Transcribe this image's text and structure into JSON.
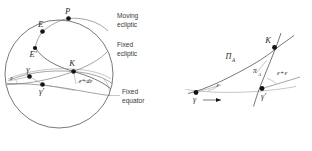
{
  "figure": {
    "title_hidden": "",
    "background_color": "#ffffff",
    "ink_color": "#3f3f3f",
    "label_color": "#2b2b2b",
    "dot_color": "#141414"
  },
  "left_diagram": {
    "name": "celestial-sphere-obliquity",
    "circle": {
      "cx": 59,
      "cy": 74,
      "r": 54
    },
    "points": [
      {
        "id": "P",
        "label": "P",
        "x": 68.5,
        "y": 18.5,
        "label_dx": -1.0,
        "label_dy": -5.0
      },
      {
        "id": "E",
        "label": "E",
        "x": 42.5,
        "y": 31.5,
        "label_dx": -2.0,
        "label_dy": -5.0
      },
      {
        "id": "Eprime",
        "label": "E′",
        "x": 35.0,
        "y": 48.0,
        "label_dx": -2.0,
        "label_dy": 8.5
      },
      {
        "id": "gamma",
        "label": "γ",
        "x": 29.5,
        "y": 76.5,
        "label_dx": -1.5,
        "label_dy": -5.0
      },
      {
        "id": "gammap",
        "label": "γ′",
        "x": 42.5,
        "y": 84.5,
        "label_dx": -1.0,
        "label_dy": 9.0
      },
      {
        "id": "K",
        "label": "K",
        "x": 73.5,
        "y": 71.5,
        "label_dx": -1.5,
        "label_dy": -5.5
      }
    ],
    "angle_labels": [
      {
        "id": "epsilon-left",
        "label": "ε",
        "x": 11.5,
        "y": 80.0
      },
      {
        "id": "epsilon-plus-de",
        "label": "ε+dε",
        "x": 79.0,
        "y": 82.5
      }
    ],
    "callouts": [
      {
        "id": "moving-ecliptic",
        "lines": [
          "Moving",
          "ecliptic"
        ],
        "x": 117,
        "y": 18
      },
      {
        "id": "fixed-ecliptic",
        "lines": [
          "Fixed",
          "ecliptic"
        ],
        "x": 117,
        "y": 47
      },
      {
        "id": "fixed-equator",
        "lines": [
          "Fixed",
          "equator"
        ],
        "x": 122,
        "y": 94
      }
    ],
    "leaders": [
      {
        "id": "leader-fixed-equator",
        "x1": 109,
        "y1": 95.5,
        "x2": 120,
        "y2": 95.5
      }
    ]
  },
  "right_diagram": {
    "name": "precession-angle-detail",
    "points": [
      {
        "id": "gamma",
        "label": "γ",
        "x": 196.0,
        "y": 92.5,
        "label_dx": -1.5,
        "label_dy": 9.5
      },
      {
        "id": "K",
        "label": "K",
        "x": 274.5,
        "y": 47.5,
        "label_dx": -6.5,
        "label_dy": -4.5
      },
      {
        "id": "gammap",
        "label": "γ′",
        "x": 262.0,
        "y": 88.5,
        "label_dx": 1.5,
        "label_dy": 10.0
      }
    ],
    "angle_labels": [
      {
        "id": "Pi-A",
        "label_main": "Π",
        "label_sub": "A",
        "x": 228.5,
        "y": 59.0
      },
      {
        "id": "pi-A",
        "label_main": "π",
        "label_sub": "A",
        "x": 255.0,
        "y": 72.5
      },
      {
        "id": "epsilon",
        "label_main": "ε",
        "label_sub": "",
        "x": 218.0,
        "y": 86.5
      },
      {
        "id": "eps-plus-eps",
        "label_main": "ε+ε",
        "label_sub": "",
        "x": 277.0,
        "y": 74.5
      }
    ],
    "motion_arrow": {
      "id": "motion-arrow",
      "x1": 203.0,
      "y1": 100.0,
      "x2": 223.0,
      "y2": 100.0
    }
  }
}
